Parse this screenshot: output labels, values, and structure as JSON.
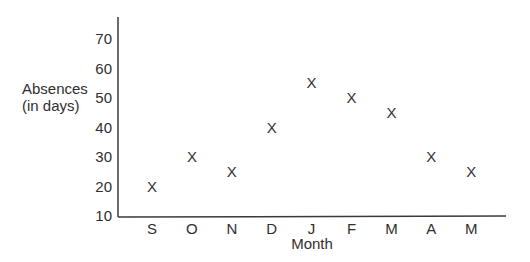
{
  "chart_data": {
    "type": "scatter",
    "title": "",
    "xlabel": "Month",
    "ylabel": "Absences\n(in days)",
    "ylabel_lines": [
      "Absences",
      "(in days)"
    ],
    "categories": [
      "S",
      "O",
      "N",
      "D",
      "J",
      "F",
      "M",
      "A",
      "M"
    ],
    "values": [
      20,
      30,
      25,
      40,
      55,
      50,
      45,
      30,
      25
    ],
    "marker": "X",
    "yticks": [
      10,
      20,
      30,
      40,
      50,
      60,
      70
    ],
    "ylim": [
      10,
      73
    ],
    "grid": false,
    "legend": null
  }
}
